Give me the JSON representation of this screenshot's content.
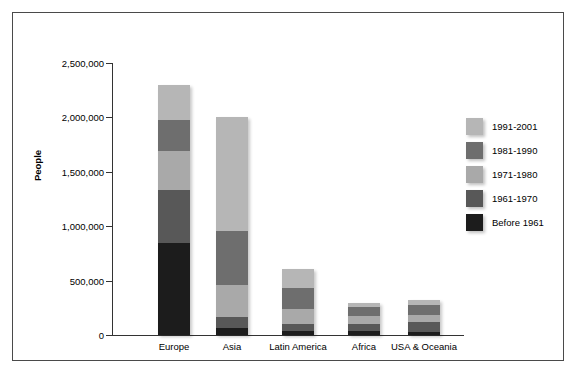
{
  "figure": {
    "source_note": "Source: Statistics Canada, 2001 Census."
  },
  "chart_data": {
    "type": "bar",
    "subtype": "stacked-vertical",
    "title": "",
    "xlabel": "",
    "ylabel": "People",
    "ylim": [
      0,
      2500000
    ],
    "ytick_labels": [
      "2,500,000",
      "2,000,000",
      "1,500,000",
      "1,000,000",
      "500,000",
      "0"
    ],
    "ytick_values": [
      2500000,
      2000000,
      1500000,
      1000000,
      500000,
      0
    ],
    "grid": false,
    "legend_position": "right",
    "categories": [
      "Europe",
      "Asia",
      "Latin America",
      "Africa",
      "USA & Oceania"
    ],
    "series": [
      {
        "name": "Before 1961",
        "color": "#1c1c1c",
        "values": [
          845000,
          65000,
          40000,
          40000,
          30000
        ]
      },
      {
        "name": "1961-1970",
        "color": "#585858",
        "values": [
          487000,
          100000,
          60000,
          65000,
          90000
        ]
      },
      {
        "name": "1971-1980",
        "color": "#a9a9a9",
        "values": [
          358000,
          295000,
          140000,
          70000,
          60000
        ]
      },
      {
        "name": "1981-1990",
        "color": "#6e6e6e",
        "values": [
          285000,
          495000,
          190000,
          80000,
          100000
        ]
      },
      {
        "name": "1991-2001",
        "color": "#b6b6b6",
        "values": [
          322000,
          1045000,
          175000,
          35000,
          40000
        ]
      }
    ],
    "totals": [
      2297000,
      2000000,
      605000,
      290000,
      320000
    ]
  },
  "legend": {
    "entries": [
      {
        "label": "1991-2001",
        "color": "#b6b6b6"
      },
      {
        "label": "1981-1990",
        "color": "#6e6e6e"
      },
      {
        "label": "1971-1980",
        "color": "#a9a9a9"
      },
      {
        "label": "1961-1970",
        "color": "#585858"
      },
      {
        "label": "Before 1961",
        "color": "#1c1c1c"
      }
    ]
  }
}
